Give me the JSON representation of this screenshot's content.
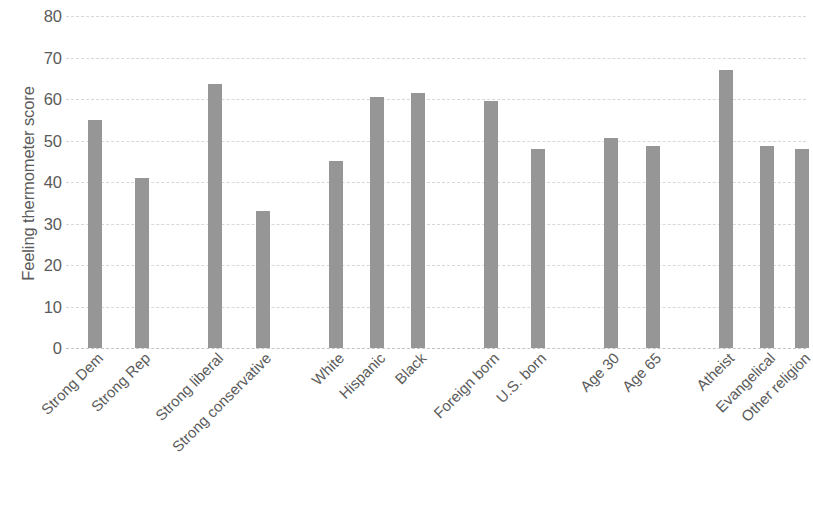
{
  "chart_data": {
    "type": "bar",
    "title": "",
    "subtitle": "",
    "xlabel": "",
    "ylabel": "Feeling thermometer score",
    "ylim": [
      0,
      80
    ],
    "ytick_values": [
      80,
      70,
      60,
      50,
      40,
      30,
      20,
      10,
      0
    ],
    "ytick_labels": [
      "80",
      "70",
      "60",
      "50",
      "40",
      "30",
      "20",
      "10",
      "0"
    ],
    "ytick_step": 10,
    "grid": true,
    "grid_axis": "y",
    "grid_style": "dashed",
    "legend": false,
    "legend_position": "none",
    "bar_color": "#969696",
    "gridline_color": "#d8d8d8",
    "text_color": "#5a5a5a",
    "background_color": "#ffffff",
    "xtick_rotation": -45,
    "categories": [
      "Strong Dem",
      "Strong Rep",
      "Strong liberal",
      "Strong conservative",
      "White",
      "Hispanic",
      "Black",
      "Foreign born",
      "U.S. born",
      "Age 30",
      "Age 65",
      "Atheist",
      "Evangelical",
      "Other religion"
    ],
    "values": [
      55,
      41,
      63.5,
      33,
      45,
      60.5,
      61.5,
      59.5,
      48,
      50.5,
      48.7,
      67,
      48.7,
      48
    ],
    "groups": [
      {
        "name": "Party identification",
        "categories": [
          "Strong Dem",
          "Strong Rep"
        ]
      },
      {
        "name": "Ideology",
        "categories": [
          "Strong liberal",
          "Strong conservative"
        ]
      },
      {
        "name": "Race and ethnicity",
        "categories": [
          "White",
          "Hispanic",
          "Black"
        ]
      },
      {
        "name": "Nativity",
        "categories": [
          "Foreign born",
          "U.S. born"
        ]
      },
      {
        "name": "Age",
        "categories": [
          "Age 30",
          "Age 65"
        ]
      },
      {
        "name": "Religion",
        "categories": [
          "Atheist",
          "Evangelical",
          "Other religion"
        ]
      }
    ],
    "bars": [
      {
        "label": "Strong Dem",
        "value": 55,
        "x_center_pct": 3.9
      },
      {
        "label": "Strong Rep",
        "value": 41,
        "x_center_pct": 10.3
      },
      {
        "label": "Strong liberal",
        "value": 63.5,
        "x_center_pct": 20.2
      },
      {
        "label": "Strong conservative",
        "value": 33,
        "x_center_pct": 26.6
      },
      {
        "label": "White",
        "value": 45,
        "x_center_pct": 36.5
      },
      {
        "label": "Hispanic",
        "value": 60.5,
        "x_center_pct": 42.0
      },
      {
        "label": "Black",
        "value": 61.5,
        "x_center_pct": 47.6
      },
      {
        "label": "Foreign born",
        "value": 59.5,
        "x_center_pct": 57.4
      },
      {
        "label": "U.S. born",
        "value": 48,
        "x_center_pct": 63.8
      },
      {
        "label": "Age 30",
        "value": 50.5,
        "x_center_pct": 73.7
      },
      {
        "label": "Age 65",
        "value": 48.7,
        "x_center_pct": 79.3
      },
      {
        "label": "Atheist",
        "value": 67,
        "x_center_pct": 89.2
      },
      {
        "label": "Evangelical",
        "value": 48.7,
        "x_center_pct": 94.7
      },
      {
        "label": "Other religion",
        "value": 48,
        "x_center_pct": 99.4
      }
    ]
  }
}
